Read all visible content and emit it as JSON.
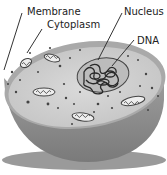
{
  "diagram": {
    "labels": [
      {
        "id": "membrane",
        "text": "Membrane"
      },
      {
        "id": "cytoplasm",
        "text": "Cytoplasm"
      },
      {
        "id": "nucleus",
        "text": "Nucleus"
      },
      {
        "id": "dna",
        "text": "DNA"
      }
    ],
    "colors": {
      "cell_top": "#cfcfcf",
      "cell_side": "#8f8f8f",
      "rim": "#a8a8a8",
      "shadow": "#9a9a9a",
      "nucleus_fill": "#bdbdbd",
      "dna": "#2a2a2a",
      "text": "#222222"
    }
  }
}
